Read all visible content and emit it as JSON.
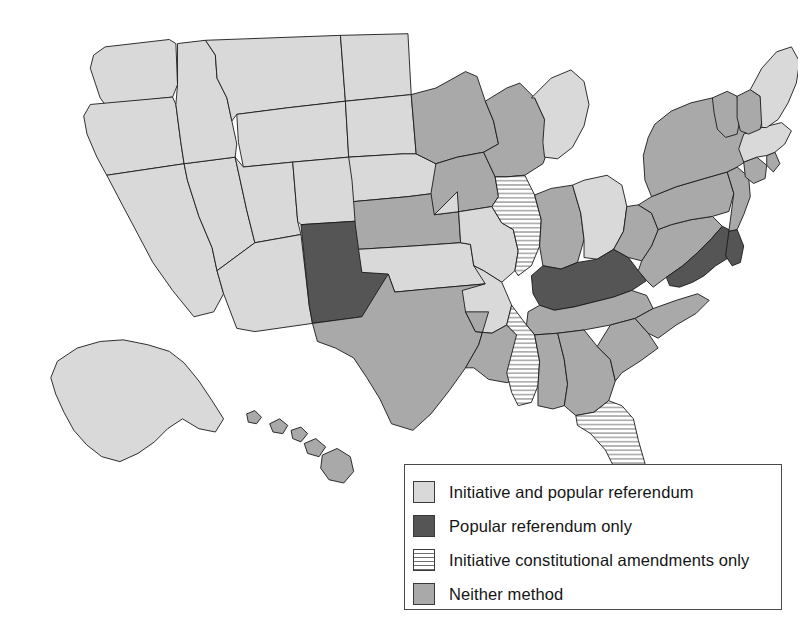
{
  "figure": {
    "kind": "choropleth-map",
    "region": "United States",
    "title": ""
  },
  "palette": {
    "initiative_and_popular_referendum": "#d9d9d9",
    "popular_referendum_only": "#555555",
    "initiative_constitutional_amendments_only": "#ffffff",
    "neither_method": "#a9a9a9",
    "stripe_line": "#6e6e6e",
    "border": "#1a1a1a",
    "background": "#ffffff"
  },
  "legend": {
    "entries": [
      {
        "label": "Initiative and popular referendum",
        "swatch": "light-gray",
        "color": "#d9d9d9"
      },
      {
        "label": "Popular referendum only",
        "swatch": "dark-gray",
        "color": "#555555"
      },
      {
        "label": "Initiative constitutional amendments only",
        "swatch": "horizontal-stripes",
        "color": "#ffffff"
      },
      {
        "label": "Neither method",
        "swatch": "medium-gray",
        "color": "#a9a9a9"
      }
    ]
  },
  "chart_data": {
    "type": "map",
    "title": "",
    "categories": [
      "Initiative and popular referendum",
      "Popular referendum only",
      "Initiative constitutional amendments only",
      "Neither method"
    ],
    "legend_position": "bottom-right",
    "states": [
      {
        "code": "WA",
        "name": "Washington",
        "category": "Initiative and popular referendum"
      },
      {
        "code": "OR",
        "name": "Oregon",
        "category": "Initiative and popular referendum"
      },
      {
        "code": "CA",
        "name": "California",
        "category": "Initiative and popular referendum"
      },
      {
        "code": "NV",
        "name": "Nevada",
        "category": "Initiative and popular referendum"
      },
      {
        "code": "ID",
        "name": "Idaho",
        "category": "Initiative and popular referendum"
      },
      {
        "code": "MT",
        "name": "Montana",
        "category": "Initiative and popular referendum"
      },
      {
        "code": "WY",
        "name": "Wyoming",
        "category": "Initiative and popular referendum"
      },
      {
        "code": "UT",
        "name": "Utah",
        "category": "Initiative and popular referendum"
      },
      {
        "code": "AZ",
        "name": "Arizona",
        "category": "Initiative and popular referendum"
      },
      {
        "code": "CO",
        "name": "Colorado",
        "category": "Initiative and popular referendum"
      },
      {
        "code": "NM",
        "name": "New Mexico",
        "category": "Popular referendum only"
      },
      {
        "code": "ND",
        "name": "North Dakota",
        "category": "Initiative and popular referendum"
      },
      {
        "code": "SD",
        "name": "South Dakota",
        "category": "Initiative and popular referendum"
      },
      {
        "code": "NE",
        "name": "Nebraska",
        "category": "Initiative and popular referendum"
      },
      {
        "code": "KS",
        "name": "Kansas",
        "category": "Neither method"
      },
      {
        "code": "OK",
        "name": "Oklahoma",
        "category": "Initiative and popular referendum"
      },
      {
        "code": "TX",
        "name": "Texas",
        "category": "Neither method"
      },
      {
        "code": "MN",
        "name": "Minnesota",
        "category": "Neither method"
      },
      {
        "code": "IA",
        "name": "Iowa",
        "category": "Neither method"
      },
      {
        "code": "MO",
        "name": "Missouri",
        "category": "Initiative and popular referendum"
      },
      {
        "code": "AR",
        "name": "Arkansas",
        "category": "Initiative and popular referendum"
      },
      {
        "code": "LA",
        "name": "Louisiana",
        "category": "Neither method"
      },
      {
        "code": "WI",
        "name": "Wisconsin",
        "category": "Neither method"
      },
      {
        "code": "IL",
        "name": "Illinois",
        "category": "Initiative constitutional amendments only"
      },
      {
        "code": "MI",
        "name": "Michigan",
        "category": "Initiative and popular referendum"
      },
      {
        "code": "IN",
        "name": "Indiana",
        "category": "Neither method"
      },
      {
        "code": "OH",
        "name": "Ohio",
        "category": "Initiative and popular referendum"
      },
      {
        "code": "KY",
        "name": "Kentucky",
        "category": "Popular referendum only"
      },
      {
        "code": "TN",
        "name": "Tennessee",
        "category": "Neither method"
      },
      {
        "code": "MS",
        "name": "Mississippi",
        "category": "Initiative constitutional amendments only"
      },
      {
        "code": "AL",
        "name": "Alabama",
        "category": "Neither method"
      },
      {
        "code": "GA",
        "name": "Georgia",
        "category": "Neither method"
      },
      {
        "code": "FL",
        "name": "Florida",
        "category": "Initiative constitutional amendments only"
      },
      {
        "code": "SC",
        "name": "South Carolina",
        "category": "Neither method"
      },
      {
        "code": "NC",
        "name": "North Carolina",
        "category": "Neither method"
      },
      {
        "code": "VA",
        "name": "Virginia",
        "category": "Neither method"
      },
      {
        "code": "WV",
        "name": "West Virginia",
        "category": "Neither method"
      },
      {
        "code": "MD",
        "name": "Maryland",
        "category": "Popular referendum only"
      },
      {
        "code": "DE",
        "name": "Delaware",
        "category": "Popular referendum only"
      },
      {
        "code": "PA",
        "name": "Pennsylvania",
        "category": "Neither method"
      },
      {
        "code": "NJ",
        "name": "New Jersey",
        "category": "Neither method"
      },
      {
        "code": "NY",
        "name": "New York",
        "category": "Neither method"
      },
      {
        "code": "CT",
        "name": "Connecticut",
        "category": "Neither method"
      },
      {
        "code": "RI",
        "name": "Rhode Island",
        "category": "Neither method"
      },
      {
        "code": "MA",
        "name": "Massachusetts",
        "category": "Initiative and popular referendum"
      },
      {
        "code": "VT",
        "name": "Vermont",
        "category": "Neither method"
      },
      {
        "code": "NH",
        "name": "New Hampshire",
        "category": "Neither method"
      },
      {
        "code": "ME",
        "name": "Maine",
        "category": "Initiative and popular referendum"
      },
      {
        "code": "AK",
        "name": "Alaska",
        "category": "Initiative and popular referendum"
      },
      {
        "code": "HI",
        "name": "Hawaii",
        "category": "Neither method"
      }
    ],
    "counts": {
      "Initiative and popular referendum": 21,
      "Popular referendum only": 4,
      "Initiative constitutional amendments only": 3,
      "Neither method": 22
    }
  }
}
